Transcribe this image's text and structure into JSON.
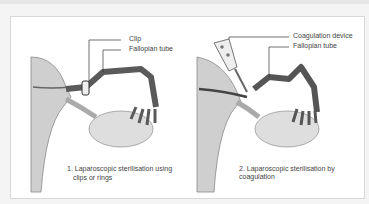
{
  "figure": {
    "panels": [
      {
        "labels": [
          "Clip",
          "Fallopian tube"
        ],
        "caption_line1": "1. Laparoscopic sterilisation using",
        "caption_line2": "clips or rings"
      },
      {
        "labels": [
          "Coagulation device",
          "Fallopian tube"
        ],
        "caption_line1": "2. Laparoscopic sterilisation by coagulation"
      }
    ],
    "colors": {
      "tissue": "#c9c9c9",
      "tube": "#555555",
      "ovary": "#d8d8d8",
      "background": "#ffffff"
    }
  }
}
